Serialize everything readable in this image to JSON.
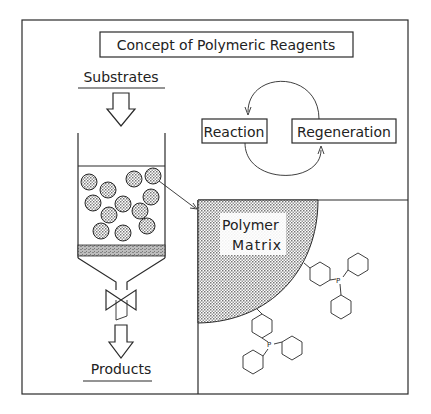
{
  "title": "Concept of Polymeric Reagents",
  "column": {
    "input_label": "Substrates",
    "output_label": "Products",
    "bead_count": 12
  },
  "cycle": {
    "left_box": "Reaction",
    "right_box": "Regeneration"
  },
  "inset": {
    "matrix_label_line1": "Polymer",
    "matrix_label_line2": "Matrix",
    "functional_group_atom": "P",
    "functional_group": "triphenylphosphine"
  },
  "colors": {
    "line": "#2a2a2a",
    "stipple": "#9a9a9a",
    "background": "#ffffff"
  }
}
